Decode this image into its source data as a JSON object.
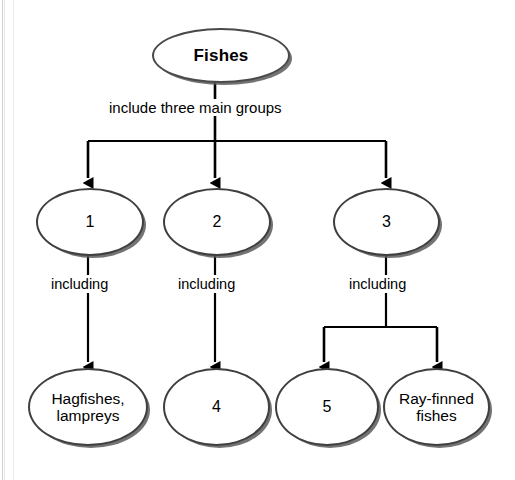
{
  "diagram": {
    "title": "Fishes",
    "type": "concept-map",
    "root": {
      "id": "root",
      "label": "Fishes"
    },
    "connectors": {
      "root_to_groups": "include three main groups",
      "group1_to_child": "including",
      "group2_to_child": "including",
      "group3_to_children": "including"
    },
    "groups": [
      {
        "id": "group-1",
        "label": "1"
      },
      {
        "id": "group-2",
        "label": "2"
      },
      {
        "id": "group-3",
        "label": "3"
      }
    ],
    "leaves": [
      {
        "id": "leaf-hagfishes-lampreys",
        "line1": "Hagfishes,",
        "line2": "lampreys"
      },
      {
        "id": "leaf-4",
        "line1": "4",
        "line2": ""
      },
      {
        "id": "leaf-5",
        "line1": "5",
        "line2": ""
      },
      {
        "id": "leaf-ray-finned-fishes",
        "line1": "Ray-finned",
        "line2": "fishes"
      }
    ],
    "colors": {
      "stroke": "#3f3f3f",
      "shadow": "#5a5a5a",
      "text": "#000000",
      "background": "#ffffff"
    }
  }
}
